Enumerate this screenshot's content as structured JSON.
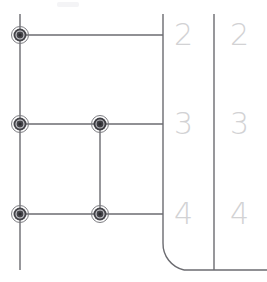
{
  "drawing": {
    "title": "",
    "background_color": "#ffffff",
    "line_color": "#6b6b70",
    "node_color": "#3a3a3e",
    "label_color": "#d2d2d4",
    "faint_mark_color": "#f2f2f4",
    "width": 267,
    "height": 282
  },
  "grid": {
    "vertical_lines": [
      {
        "name": "left-rail",
        "x": 20,
        "y1": 14,
        "y2": 270
      },
      {
        "name": "branch-riser",
        "x": 100,
        "y1": 124,
        "y2": 214
      },
      {
        "name": "inner-boundary",
        "x": 163,
        "y1": 14,
        "y2": 243
      },
      {
        "name": "outer-boundary",
        "x": 214,
        "y1": 14,
        "y2": 270
      }
    ],
    "horizontal_lines": [
      {
        "name": "row-2-rung",
        "y": 35,
        "x1": 20,
        "x2": 163
      },
      {
        "name": "row-3-rung",
        "y": 124,
        "x1": 20,
        "x2": 163
      },
      {
        "name": "row-4-rung",
        "y": 214,
        "x1": 20,
        "x2": 163
      },
      {
        "name": "baseline",
        "y": 270,
        "x1": 184,
        "x2": 267
      }
    ],
    "corner_fillet": {
      "name": "bottom-left-fillet",
      "start_x": 163,
      "start_y": 243,
      "end_x": 184,
      "end_y": 270,
      "radius": 27
    }
  },
  "nodes": [
    {
      "id": "node-r2-c1",
      "x": 20,
      "y": 35,
      "row": "2",
      "column": "1"
    },
    {
      "id": "node-r3-c1",
      "x": 20,
      "y": 124,
      "row": "3",
      "column": "1"
    },
    {
      "id": "node-r3-c2",
      "x": 100,
      "y": 124,
      "row": "3",
      "column": "2"
    },
    {
      "id": "node-r4-c1",
      "x": 20,
      "y": 214,
      "row": "4",
      "column": "1"
    },
    {
      "id": "node-r4-c2",
      "x": 100,
      "y": 214,
      "row": "4",
      "column": "2"
    }
  ],
  "labels": {
    "inner_column": [
      {
        "text": "2",
        "x": 174,
        "y": 20
      },
      {
        "text": "3",
        "x": 174,
        "y": 109
      },
      {
        "text": "4",
        "x": 174,
        "y": 199
      }
    ],
    "outer_column": [
      {
        "text": "2",
        "x": 230,
        "y": 20
      },
      {
        "text": "3",
        "x": 230,
        "y": 109
      },
      {
        "text": "4",
        "x": 230,
        "y": 199
      }
    ]
  },
  "faint_mark": {
    "name": "top-scuff",
    "x": 57,
    "y": 2,
    "width": 22,
    "height": 5
  }
}
